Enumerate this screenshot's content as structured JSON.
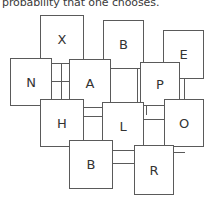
{
  "caption": {
    "text": "probability that one chooses."
  },
  "diagram": {
    "type": "node-link-grid",
    "box_border_color": "#5a5a5a",
    "box_fill_color": "#ffffff",
    "label_color": "#333333",
    "nodes": [
      {
        "id": "X",
        "label": "X",
        "x": 40,
        "y": 15,
        "w": 44,
        "h": 49
      },
      {
        "id": "B1",
        "label": "B",
        "x": 103,
        "y": 20,
        "w": 41,
        "h": 49
      },
      {
        "id": "E",
        "label": "E",
        "x": 163,
        "y": 30,
        "w": 41,
        "h": 49
      },
      {
        "id": "N",
        "label": "N",
        "x": 10,
        "y": 58,
        "w": 42,
        "h": 48
      },
      {
        "id": "A",
        "label": "A",
        "x": 69,
        "y": 59,
        "w": 42,
        "h": 49
      },
      {
        "id": "P",
        "label": "P",
        "x": 140,
        "y": 62,
        "w": 40,
        "h": 44
      },
      {
        "id": "H",
        "label": "H",
        "x": 40,
        "y": 99,
        "w": 44,
        "h": 48
      },
      {
        "id": "L",
        "label": "L",
        "x": 102,
        "y": 102,
        "w": 42,
        "h": 49
      },
      {
        "id": "O",
        "label": "O",
        "x": 164,
        "y": 99,
        "w": 40,
        "h": 48
      },
      {
        "id": "B2",
        "label": "B",
        "x": 69,
        "y": 140,
        "w": 44,
        "h": 49
      },
      {
        "id": "R",
        "label": "R",
        "x": 134,
        "y": 145,
        "w": 40,
        "h": 50
      }
    ],
    "links": [
      {
        "from": "X",
        "to": "A",
        "orientation": "vertical",
        "x": 61,
        "y": 63,
        "length": 37
      },
      {
        "from": "X",
        "to": "N",
        "orientation": "horizontal",
        "x": 40,
        "y": 58,
        "length": 12
      },
      {
        "from": "B1",
        "to": "A",
        "orientation": "horizontal",
        "x": 84,
        "y": 59,
        "length": 20
      },
      {
        "from": "B1",
        "to": "E",
        "orientation": "horizontal",
        "x": 143,
        "y": 62,
        "length": 21
      },
      {
        "from": "B1",
        "to": "L",
        "orientation": "vertical",
        "x": 110,
        "y": 68,
        "length": 35
      },
      {
        "from": "B1",
        "to": "P",
        "orientation": "vertical",
        "x": 137,
        "y": 68,
        "length": 35
      },
      {
        "from": "N",
        "to": "A",
        "orientation": "horizontal",
        "x": 51,
        "y": 81,
        "length": 19
      },
      {
        "from": "N",
        "to": "H",
        "orientation": "vertical",
        "x": 61,
        "y": 75,
        "length": 25
      },
      {
        "from": "E",
        "to": "O",
        "orientation": "vertical",
        "x": 184,
        "y": 78,
        "length": 22
      },
      {
        "from": "A",
        "to": "H",
        "orientation": "vertical",
        "x": 78,
        "y": 85,
        "length": 15
      },
      {
        "from": "A",
        "to": "L",
        "orientation": "vertical",
        "x": 104,
        "y": 95,
        "length": 8
      },
      {
        "from": "P",
        "to": "L",
        "orientation": "vertical",
        "x": 146,
        "y": 105,
        "length": 10
      },
      {
        "from": "P",
        "to": "O",
        "orientation": "horizontal",
        "x": 179,
        "y": 99,
        "length": 6
      },
      {
        "from": "H",
        "to": "L",
        "orientation": "horizontal",
        "x": 83,
        "y": 116,
        "length": 20
      },
      {
        "from": "H",
        "to": "B2",
        "orientation": "vertical",
        "x": 78,
        "y": 146,
        "length": 6
      },
      {
        "from": "L",
        "to": "O",
        "orientation": "horizontal",
        "x": 143,
        "y": 119,
        "length": 22
      },
      {
        "from": "L",
        "to": "B2",
        "orientation": "vertical",
        "x": 105,
        "y": 150,
        "length": 6
      },
      {
        "from": "L",
        "to": "R",
        "orientation": "vertical",
        "x": 138,
        "y": 150,
        "length": 6
      },
      {
        "from": "B2",
        "to": "R",
        "orientation": "horizontal",
        "x": 112,
        "y": 163,
        "length": 23
      },
      {
        "from": "O",
        "to": "R",
        "orientation": "horizontal",
        "x": 173,
        "y": 152,
        "length": 12
      }
    ]
  }
}
